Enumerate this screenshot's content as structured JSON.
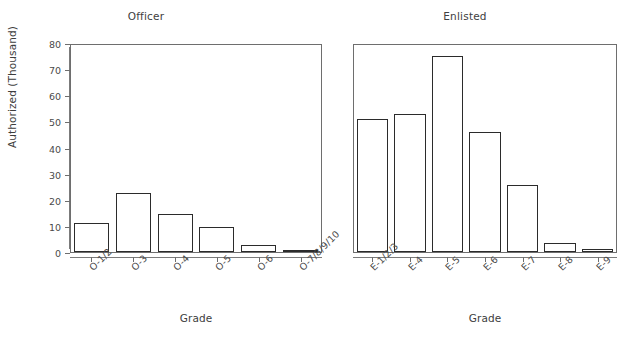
{
  "chart_data": {
    "type": "bar",
    "title": "",
    "ylabel": "Authorized (Thousand)",
    "xlabel": "Grade",
    "ylim": [
      0,
      80
    ],
    "yticks": [
      0,
      10,
      20,
      30,
      40,
      50,
      60,
      70,
      80
    ],
    "grid": false,
    "legend": "none",
    "panels": [
      {
        "title": "Officer",
        "xlabel": "Grade",
        "ylabel": "Authorized (Thousand)",
        "categories": [
          "O-1/2",
          "O-3",
          "O-4",
          "O-5",
          "O-6",
          "O-7/8/9/10"
        ],
        "values": [
          11,
          22.5,
          14.7,
          9.6,
          2.7,
          0.4
        ]
      },
      {
        "title": "Enlisted",
        "xlabel": "Grade",
        "ylabel": "",
        "categories": [
          "E-1/2/3",
          "E-4",
          "E-5",
          "E-6",
          "E-7",
          "E-8",
          "E-9"
        ],
        "values": [
          51,
          53,
          75,
          46,
          25.7,
          3.3,
          1.2
        ]
      }
    ]
  },
  "officer": {
    "title": "Officer",
    "xlabel": "Grade",
    "ylabel": "Authorized (Thousand)",
    "categories": [
      "O-1/2",
      "O-3",
      "O-4",
      "O-5",
      "O-6",
      "O-7/8/9/10"
    ],
    "values": [
      11,
      22.5,
      14.7,
      9.6,
      2.7,
      0.4
    ]
  },
  "enlisted": {
    "title": "Enlisted",
    "xlabel": "Grade",
    "categories": [
      "E-1/2/3",
      "E-4",
      "E-5",
      "E-6",
      "E-7",
      "E-8",
      "E-9"
    ],
    "values": [
      51,
      53,
      75,
      46,
      25.7,
      3.3,
      1.2
    ]
  },
  "yticks": [
    "0",
    "10",
    "20",
    "30",
    "40",
    "50",
    "60",
    "70",
    "80"
  ],
  "colors": {
    "bar_fill": "#ffffff",
    "bar_stroke": "#2b2b2b",
    "axis": "#6e6e6e",
    "text": "#3d3d3d",
    "background": "#ffffff"
  }
}
